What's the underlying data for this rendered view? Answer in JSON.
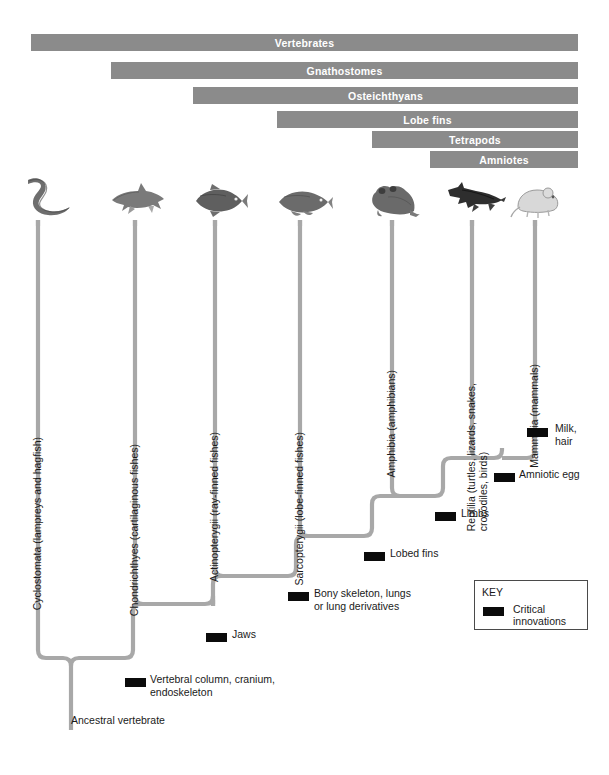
{
  "figure": {
    "type": "phylogenetic-cladogram"
  },
  "clade_bars": [
    {
      "label": "Vertebrates",
      "left": 31,
      "right": 578,
      "top": 34
    },
    {
      "label": "Gnathostomes",
      "left": 111,
      "right": 578,
      "top": 62
    },
    {
      "label": "Osteichthyans",
      "left": 193,
      "right": 578,
      "top": 87
    },
    {
      "label": "Lobe fins",
      "left": 277,
      "right": 578,
      "top": 111
    },
    {
      "label": "Tetrapods",
      "left": 372,
      "right": 578,
      "top": 131
    },
    {
      "label": "Amniotes",
      "left": 430,
      "right": 578,
      "top": 151
    }
  ],
  "taxa": [
    {
      "label": "Cyclostomata (lampreys and hagfish)",
      "stem_x": 38,
      "silhouette": "lamprey-silhouette",
      "label_top": 425
    },
    {
      "label": "Chondrichthyes (cartilaginous fishes)",
      "stem_x": 135,
      "silhouette": "shark-silhouette",
      "label_top": 432
    },
    {
      "label": "Actinopterygii (ray-finned fishes)",
      "stem_x": 215,
      "silhouette": "rayfin-fish-silhouette",
      "label_top": 420
    },
    {
      "label": "Sarcopterygii (lobe-finned fishes)",
      "stem_x": 300,
      "silhouette": "lobefin-fish-silhouette",
      "label_top": 420
    },
    {
      "label": "Amphibia (amphibians)",
      "stem_x": 392,
      "silhouette": "frog-silhouette",
      "label_top": 358
    },
    {
      "label": "Reptilia (turtles, lizards, snakes,\ncrocodiles, birds)",
      "stem_x": 472,
      "silhouette": "crocodile-silhouette",
      "label_top": 360
    },
    {
      "label": "Mammalia (mammals)",
      "stem_x": 535,
      "silhouette": "mouse-silhouette",
      "label_top": 352
    }
  ],
  "nodes": [
    {
      "name": "milk-hair",
      "label": "Milk,\nhair",
      "mark_x": 527,
      "mark_y": 428,
      "label_x": 555,
      "label_y": 422
    },
    {
      "name": "amniotic-egg",
      "label": "Amniotic egg",
      "mark_x": 494,
      "mark_y": 473,
      "label_x": 519,
      "label_y": 468
    },
    {
      "name": "limbs",
      "label": "Limbs",
      "mark_x": 435,
      "mark_y": 512,
      "label_x": 461,
      "label_y": 507
    },
    {
      "name": "lobed-fins",
      "label": "Lobed fins",
      "mark_x": 364,
      "mark_y": 552,
      "label_x": 390,
      "label_y": 547
    },
    {
      "name": "bony-skeleton",
      "label": "Bony skeleton, lungs\nor lung derivatives",
      "mark_x": 288,
      "mark_y": 592,
      "label_x": 314,
      "label_y": 587
    },
    {
      "name": "jaws",
      "label": "Jaws",
      "mark_x": 206,
      "mark_y": 633,
      "label_x": 232,
      "label_y": 628
    },
    {
      "name": "vertebral-column",
      "label": "Vertebral column, cranium,\nendoskeleton",
      "mark_x": 125,
      "mark_y": 678,
      "label_x": 150,
      "label_y": 673
    }
  ],
  "root": {
    "label": "Ancestral vertebrate",
    "x": 71,
    "y": 714
  },
  "key": {
    "title": "KEY",
    "entry_label": "Critical innovations",
    "swatch_color": "#0b0b0b"
  },
  "colors": {
    "bar_gray": "#8b8b8b",
    "branch_gray": "#a8a8a8",
    "innovation_black": "#0b0b0b",
    "text": "#1a1a1a",
    "background": "#ffffff"
  }
}
